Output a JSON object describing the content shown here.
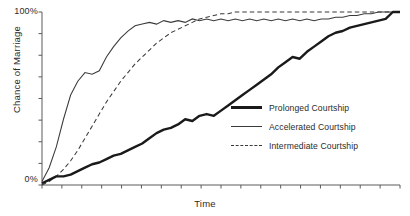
{
  "chart_data": {
    "type": "line",
    "title": "",
    "xlabel": "Time",
    "ylabel": "Chance of Marriage",
    "grid": false,
    "legend_position": "center-right-inside",
    "xlim": [
      0,
      100
    ],
    "ylim": [
      0,
      100
    ],
    "ytick_labels": [
      "0%",
      "100%"
    ],
    "ytick_values": [
      0,
      100
    ],
    "ytick_count_unlabeled": 8,
    "xtick_labels": [],
    "xtick_count": 19,
    "x": [
      0,
      2,
      4,
      6,
      8,
      10,
      12,
      14,
      16,
      18,
      20,
      22,
      24,
      26,
      28,
      30,
      32,
      34,
      36,
      38,
      40,
      42,
      44,
      46,
      48,
      50,
      52,
      54,
      56,
      58,
      60,
      62,
      64,
      66,
      68,
      70,
      72,
      74,
      76,
      78,
      80,
      82,
      84,
      86,
      88,
      90,
      92,
      94,
      96,
      98,
      100
    ],
    "series": [
      {
        "name": "Prolonged Courtship",
        "style": "solid",
        "width": "thick",
        "color": "#1a1a1a",
        "values": [
          1,
          3,
          5,
          5,
          6,
          8,
          10,
          12,
          13,
          15,
          17,
          18,
          20,
          22,
          24,
          27,
          30,
          32,
          33,
          35,
          38,
          37,
          40,
          41,
          40,
          43,
          46,
          49,
          52,
          55,
          58,
          61,
          64,
          68,
          71,
          74,
          73,
          77,
          80,
          83,
          86,
          88,
          89,
          91,
          92,
          93,
          94,
          95,
          96,
          100,
          100
        ]
      },
      {
        "name": "Accelerated Courtship",
        "style": "solid",
        "width": "thin",
        "color": "#3a3a3a",
        "values": [
          2,
          10,
          22,
          38,
          52,
          60,
          65,
          64,
          66,
          74,
          80,
          85,
          89,
          92,
          93,
          94,
          93,
          95,
          94,
          95,
          94,
          96,
          95,
          96,
          95,
          96,
          95,
          96,
          95,
          96,
          95,
          96,
          95,
          96,
          95,
          96,
          95,
          96,
          95,
          96,
          96,
          97,
          97,
          98,
          98,
          99,
          99,
          100,
          100,
          100,
          100
        ]
      },
      {
        "name": "Intermediate Courtship",
        "style": "dashed",
        "width": "thin",
        "color": "#3a3a3a",
        "values": [
          0,
          2,
          5,
          9,
          14,
          20,
          27,
          34,
          41,
          48,
          54,
          60,
          65,
          70,
          74,
          78,
          82,
          85,
          88,
          90,
          92,
          94,
          96,
          97,
          98,
          99,
          99,
          100,
          100,
          100,
          100,
          100,
          100,
          100,
          100,
          100,
          100,
          100,
          100,
          100,
          100,
          100,
          100,
          100,
          100,
          100,
          100,
          100,
          100,
          100,
          100
        ]
      }
    ]
  },
  "axes": {
    "y_top_label": "100%",
    "y_bottom_label": "0%",
    "y_title": "Chance of Marriage",
    "x_title": "Time"
  },
  "legend": {
    "entries": [
      {
        "label": "Prolonged Courtship"
      },
      {
        "label": "Accelerated Courtship"
      },
      {
        "label": "Intermediate Courtship"
      }
    ]
  }
}
